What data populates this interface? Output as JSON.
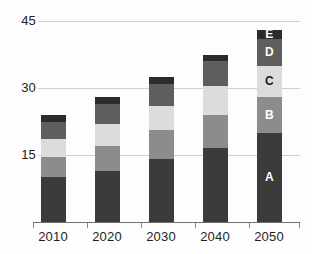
{
  "chart_data": {
    "type": "bar",
    "stacked": true,
    "title": "",
    "subtitle": "",
    "xlabel": "",
    "ylabel": "",
    "categories": [
      "2010",
      "2020",
      "2030",
      "2040",
      "2050"
    ],
    "ylim": [
      0,
      45
    ],
    "yticks": [
      15,
      30,
      45
    ],
    "ytick_labels": [
      "15",
      "30",
      "45"
    ],
    "grid": true,
    "legend_position": "inside-last-bar",
    "series": [
      {
        "name": "A",
        "label": "A",
        "color": "#3b3b3b",
        "text_color": "#ffffff",
        "values": [
          10.0,
          11.5,
          14.0,
          16.5,
          20.0
        ]
      },
      {
        "name": "B",
        "label": "B",
        "color": "#8c8c8c",
        "text_color": "#ffffff",
        "values": [
          4.5,
          5.5,
          6.5,
          7.5,
          8.0
        ]
      },
      {
        "name": "C",
        "label": "C",
        "color": "#dcdcdc",
        "text_color": "#1a1a1a",
        "values": [
          4.0,
          5.0,
          5.5,
          6.5,
          7.0
        ]
      },
      {
        "name": "D",
        "label": "D",
        "color": "#5e5e5e",
        "text_color": "#ffffff",
        "values": [
          4.0,
          4.5,
          5.0,
          5.5,
          6.0
        ]
      },
      {
        "name": "E",
        "label": "E",
        "color": "#2b2b2b",
        "text_color": "#ffffff",
        "values": [
          1.5,
          1.5,
          1.5,
          1.5,
          2.0
        ]
      }
    ],
    "totals": [
      24.0,
      28.0,
      32.5,
      37.5,
      43.0
    ],
    "annotations": [
      {
        "text": "A",
        "bar": "2050",
        "segment": "A"
      },
      {
        "text": "B",
        "bar": "2050",
        "segment": "B"
      },
      {
        "text": "C",
        "bar": "2050",
        "segment": "C"
      },
      {
        "text": "D",
        "bar": "2050",
        "segment": "D"
      },
      {
        "text": "E",
        "bar": "2050",
        "segment": "E"
      }
    ],
    "colors": {
      "gridline": "#cfcfcf",
      "axis": "#6e6e6e",
      "background": "#fdfdfd",
      "tick_text": "#222222"
    }
  }
}
